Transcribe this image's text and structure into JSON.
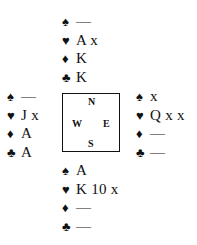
{
  "suit_symbols": {
    "spades": "♠",
    "hearts": "♥",
    "diamonds": "♦",
    "clubs": "♣"
  },
  "compass": {
    "north": "N",
    "west": "W",
    "east": "E",
    "south": "S"
  },
  "hands": {
    "north": {
      "spades": "—",
      "hearts": "A x",
      "diamonds": "K",
      "clubs": "K"
    },
    "west": {
      "spades": "—",
      "hearts": "J x",
      "diamonds": "A",
      "clubs": "A"
    },
    "east": {
      "spades": "x",
      "hearts": "Q x x",
      "diamonds": "—",
      "clubs": "—"
    },
    "south": {
      "spades": "A",
      "hearts": "K 10 x",
      "diamonds": "—",
      "clubs": "—"
    }
  }
}
